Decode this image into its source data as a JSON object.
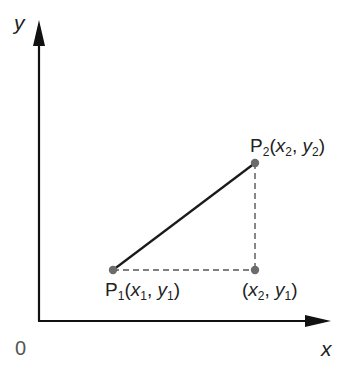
{
  "diagram": {
    "type": "coordinate-geometry",
    "axes": {
      "x_label": "x",
      "y_label": "y",
      "origin_label": "0"
    },
    "points": [
      {
        "id": "P1",
        "name": "P",
        "sub": "1",
        "coord_x": "x",
        "coord_x_sub": "1",
        "coord_y": "y",
        "coord_y_sub": "1"
      },
      {
        "id": "P2",
        "name": "P",
        "sub": "2",
        "coord_x": "x",
        "coord_x_sub": "2",
        "coord_y": "y",
        "coord_y_sub": "2"
      },
      {
        "id": "corner",
        "coord_x": "x",
        "coord_x_sub": "2",
        "coord_y": "y",
        "coord_y_sub": "1"
      }
    ],
    "punct": {
      "open": "(",
      "comma": ", ",
      "close": ")"
    },
    "colors": {
      "axis": "#111111",
      "segment": "#1a1a1a",
      "dashed": "#555555",
      "point": "#6b6b6b"
    }
  }
}
